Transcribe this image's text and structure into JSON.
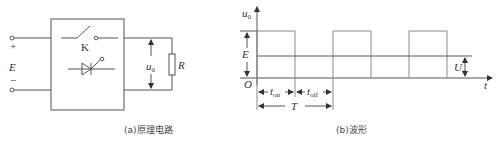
{
  "circuit": {
    "caption": "(a)原理电路",
    "labels": {
      "plus": "+",
      "minus": "−",
      "source": "E",
      "switch": "K",
      "output_voltage": "u",
      "output_voltage_sub": "0",
      "resistor": "R"
    }
  },
  "waveform": {
    "caption": "(b)波形",
    "labels": {
      "y_axis": "u",
      "y_axis_sub": "0",
      "x_axis": "t",
      "origin": "O",
      "amplitude": "E",
      "average": "U",
      "average_sub": "o",
      "t_on": "t",
      "t_on_sub": "on",
      "t_off": "t",
      "t_off_sub": "off",
      "period": "T"
    },
    "pulses": 3
  }
}
